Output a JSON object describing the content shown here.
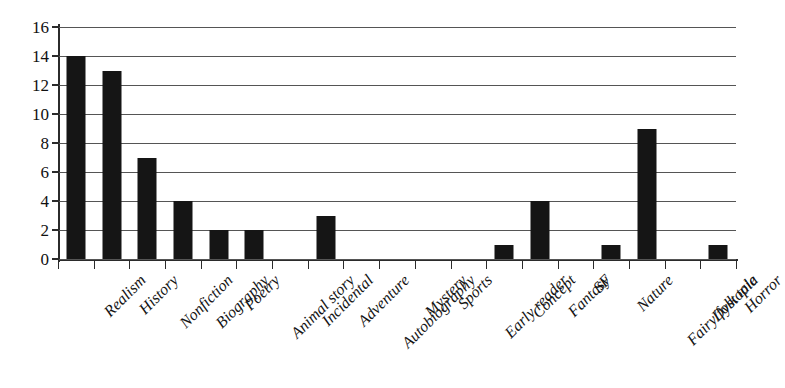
{
  "chart_data": {
    "type": "bar",
    "title": "",
    "subtitle": "",
    "xlabel": "",
    "ylabel": "",
    "ylim": [
      0,
      16
    ],
    "yticks": [
      0,
      2,
      4,
      6,
      8,
      10,
      12,
      14,
      16
    ],
    "ytick_labels": [
      "0",
      "2",
      "4",
      "6",
      "8",
      "10",
      "12",
      "14",
      "16"
    ],
    "grid": true,
    "legend": false,
    "legend_position": "none",
    "bar_color": "#151515",
    "categories": [
      "Realism",
      "History",
      "Nonfiction",
      "Biography",
      "Poetry",
      "Animal story",
      "Incidental",
      "Adventure",
      "Autobiography",
      "Mystery",
      "Sports",
      "Early reader",
      "Concept",
      "Fantasy",
      "SF",
      "Nature",
      "Fairy/folk tale",
      "Dystopia",
      "Horror"
    ],
    "values": [
      14,
      13,
      7,
      4,
      2,
      2,
      0,
      3,
      0,
      0,
      0,
      0,
      1,
      4,
      0,
      1,
      9,
      0,
      1
    ]
  }
}
